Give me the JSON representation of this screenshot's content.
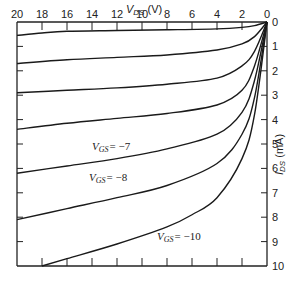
{
  "chart_data": {
    "type": "line",
    "title": "",
    "xlabel": "V_DS (V)",
    "ylabel": "I_DS (mA)",
    "x_axis_position": "top",
    "y_axis_position": "right",
    "xlim": [
      20,
      0
    ],
    "ylim": [
      0,
      10
    ],
    "x_reversed": true,
    "y_inverted": true,
    "x_ticks": [
      20,
      18,
      16,
      14,
      12,
      10,
      8,
      6,
      4,
      2,
      0
    ],
    "y_ticks": [
      0,
      1,
      2,
      3,
      4,
      5,
      6,
      7,
      8,
      9,
      10
    ],
    "grid": false,
    "legend": null,
    "annotations": [
      {
        "text": "V_GS = -7",
        "x": 9.5,
        "y": 5.2
      },
      {
        "text": "V_GS = -8",
        "x": 8.5,
        "y": 7.0
      },
      {
        "text": "V_GS = -10",
        "x": 6.0,
        "y": 9.2
      }
    ],
    "series": [
      {
        "name": "curve-1",
        "x": [
          0,
          1,
          2,
          4,
          8,
          12,
          16,
          18,
          20
        ],
        "y": [
          0,
          0.15,
          0.22,
          0.28,
          0.32,
          0.35,
          0.38,
          0.45,
          0.55
        ]
      },
      {
        "name": "curve-2",
        "x": [
          0,
          1,
          2,
          4,
          8,
          12,
          16,
          20
        ],
        "y": [
          0,
          0.6,
          0.9,
          1.15,
          1.35,
          1.45,
          1.55,
          1.7
        ]
      },
      {
        "name": "curve-3",
        "x": [
          0,
          1,
          2,
          4,
          8,
          12,
          16,
          20
        ],
        "y": [
          0,
          1.2,
          1.8,
          2.3,
          2.55,
          2.7,
          2.8,
          2.9
        ]
      },
      {
        "name": "V_GS = -7",
        "x": [
          0,
          1,
          2,
          4,
          8,
          12,
          16,
          20
        ],
        "y": [
          0,
          1.8,
          2.8,
          3.4,
          3.75,
          3.95,
          4.15,
          4.4
        ]
      },
      {
        "name": "V_GS = -8",
        "x": [
          0,
          1,
          2,
          4,
          8,
          12,
          16,
          20
        ],
        "y": [
          0,
          2.4,
          3.7,
          4.6,
          5.2,
          5.6,
          5.9,
          6.2
        ]
      },
      {
        "name": "curve-6",
        "x": [
          0,
          1,
          2,
          4,
          8,
          12,
          16,
          20
        ],
        "y": [
          0,
          3.1,
          4.6,
          5.8,
          6.7,
          7.2,
          7.65,
          8.1
        ]
      },
      {
        "name": "V_GS = -10",
        "x": [
          0,
          1,
          2,
          4,
          6,
          8,
          12,
          16,
          18
        ],
        "y": [
          0,
          3.8,
          5.6,
          7.2,
          7.9,
          8.4,
          9.1,
          9.7,
          10
        ]
      }
    ]
  },
  "labels": {
    "xlabel_main": "V",
    "xlabel_sub": "DS",
    "xlabel_unit": " (V)",
    "ylabel_main": "I",
    "ylabel_sub": "DS",
    "ylabel_unit": " (mA)",
    "vgs7_main": "V",
    "vgs7_sub": "GS",
    "vgs7_val": "= −7",
    "vgs8_main": "V",
    "vgs8_sub": "GS",
    "vgs8_val": "= −8",
    "vgs10_main": "V",
    "vgs10_sub": "GS",
    "vgs10_val": "= −10"
  }
}
